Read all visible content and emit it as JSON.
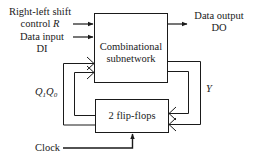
{
  "inputs": {
    "shift_control": {
      "line1": "Right-left shift",
      "line2_text": "control ",
      "line2_var": "R"
    },
    "data_input": {
      "line1": "Data input",
      "line2": "DI"
    }
  },
  "output": {
    "line1": "Data output",
    "line2": "DO"
  },
  "blocks": {
    "combinational": {
      "line1": "Combinational",
      "line2": "subnetwork"
    },
    "flipflops": {
      "label": "2 flip-flops"
    }
  },
  "feedback": {
    "state_label": {
      "q1": "Q",
      "q1_sub": "1",
      "q0": "Q",
      "q0_sub": "0"
    },
    "y_label": "Y"
  },
  "clock": {
    "label": "Clock"
  },
  "colors": {
    "stroke": "#1a1a1a",
    "background": "#ffffff"
  }
}
